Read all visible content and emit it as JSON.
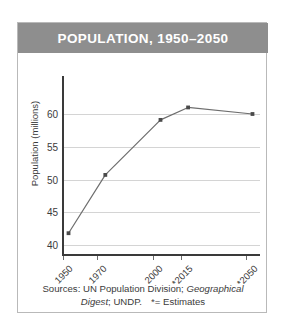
{
  "card": {
    "title": "POPULATION, 1950–2050",
    "header_color": "#8e8e8e",
    "border_color": "#b9b9b9",
    "background": "#ffffff"
  },
  "source": {
    "line1_prefix": "Sources: UN Population Division; ",
    "line1_italic": "Geographical",
    "line2_italic": "Digest",
    "line2_rest": "; UNDP.",
    "legend_note": "*= Estimates"
  },
  "chart_data": {
    "type": "line",
    "title": "POPULATION, 1950–2050",
    "xlabel": "",
    "ylabel": "Population (millions)",
    "categories": [
      "1950",
      "1970",
      "2000",
      "*2015",
      "*2050"
    ],
    "x": [
      1950,
      1970,
      2000,
      2015,
      2050
    ],
    "values": [
      41.8,
      50.7,
      59.1,
      61.0,
      60.0
    ],
    "series": [
      {
        "name": "Population",
        "values": [
          41.8,
          50.7,
          59.1,
          61.0,
          60.0
        ]
      }
    ],
    "ylim": [
      37.5,
      62.5
    ],
    "xlim": [
      1947,
      2053
    ],
    "yticks": [
      40,
      45,
      50,
      55,
      60
    ],
    "ytick_labels": [
      "40",
      "45",
      "50",
      "55",
      "60"
    ],
    "grid": true,
    "grid_axis": "y",
    "legend": false,
    "legend_position": "none",
    "line_color": "#6e6e6e",
    "marker_color": "#4a4a4a",
    "marker": "square",
    "annotations": [
      "* = Estimates"
    ]
  }
}
